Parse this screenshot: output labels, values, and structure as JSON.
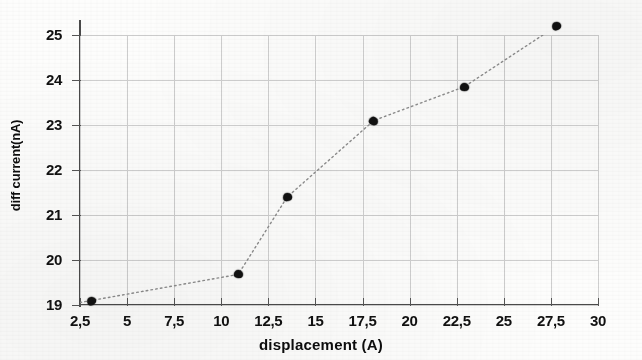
{
  "chart_data": {
    "type": "scatter",
    "title": "",
    "xlabel": "displacement (A)",
    "ylabel": "diff current(nA)",
    "xlim": [
      2.5,
      30
    ],
    "ylim": [
      19,
      25
    ],
    "grid": true,
    "legend": "none",
    "line_style": "dotted connecting line",
    "marker_style": "filled black blob",
    "x_tick_labels": [
      "2,5",
      "5",
      "7,5",
      "10",
      "12,5",
      "15",
      "17,5",
      "20",
      "22,5",
      "25",
      "27,5",
      "30"
    ],
    "x_tick_values": [
      2.5,
      5,
      7.5,
      10,
      12.5,
      15,
      17.5,
      20,
      22.5,
      25,
      27.5,
      30
    ],
    "y_tick_labels": [
      "19",
      "20",
      "21",
      "22",
      "23",
      "24",
      "25"
    ],
    "y_tick_values": [
      19,
      20,
      21,
      22,
      23,
      24,
      25
    ],
    "series": [
      {
        "name": "diff current",
        "x": [
          3.1,
          10.9,
          13.5,
          18.1,
          22.9,
          27.8
        ],
        "y": [
          19.1,
          19.68,
          21.4,
          23.1,
          23.85,
          25.2
        ]
      }
    ],
    "points": [
      {
        "x": 3.1,
        "y": 19.1
      },
      {
        "x": 10.9,
        "y": 19.68
      },
      {
        "x": 13.5,
        "y": 21.4
      },
      {
        "x": 18.1,
        "y": 23.1
      },
      {
        "x": 22.9,
        "y": 23.85
      },
      {
        "x": 27.8,
        "y": 25.2
      }
    ]
  },
  "colors": {
    "marker": "#111111",
    "axis": "#4a4a4a",
    "gridline": "#cfcfcf",
    "text": "#0d0d0d",
    "background": "#fdfdfc"
  }
}
